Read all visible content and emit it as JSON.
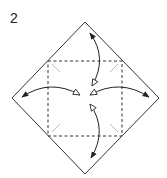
{
  "step": {
    "number": "2"
  },
  "diagram": {
    "type": "origami-fold-diagram",
    "colors": {
      "outline": "#333333",
      "dashed_fold": "#333333",
      "crease_marks": "#bbbbbb",
      "arrow": "#222222",
      "hollow_arrowhead_fill": "#ffffff"
    },
    "outline_vertices": {
      "top": [
        85,
        22
      ],
      "right": [
        159,
        98
      ],
      "bottom": [
        85,
        174
      ],
      "left": [
        12,
        98
      ]
    },
    "dashed_square": {
      "top_left": [
        48,
        61
      ],
      "top_right": [
        122,
        61
      ],
      "bottom_right": [
        122,
        136
      ],
      "bottom_left": [
        48,
        136
      ]
    },
    "crease_marks": [
      {
        "from": [
          52,
          64
        ],
        "to": [
          60,
          72
        ]
      },
      {
        "from": [
          118,
          64
        ],
        "to": [
          110,
          72
        ]
      },
      {
        "from": [
          52,
          132
        ],
        "to": [
          60,
          124
        ]
      },
      {
        "from": [
          118,
          132
        ],
        "to": [
          110,
          124
        ]
      }
    ],
    "arrows": [
      {
        "name": "fold-top-corner-arrow",
        "solid_head": [
          90,
          33
        ],
        "hollow_head": [
          92,
          86
        ],
        "direction": "top corner to center and back"
      },
      {
        "name": "fold-bottom-corner-arrow",
        "solid_head": [
          91,
          158
        ],
        "hollow_head": [
          90,
          104
        ],
        "direction": "bottom corner to center and back"
      },
      {
        "name": "fold-left-corner-arrow",
        "solid_head": [
          22,
          97
        ],
        "hollow_head": [
          80,
          95
        ],
        "direction": "left corner to center and back"
      },
      {
        "name": "fold-right-corner-arrow",
        "solid_head": [
          149,
          97
        ],
        "hollow_head": [
          90,
          95
        ],
        "direction": "right corner to center and back"
      }
    ]
  }
}
